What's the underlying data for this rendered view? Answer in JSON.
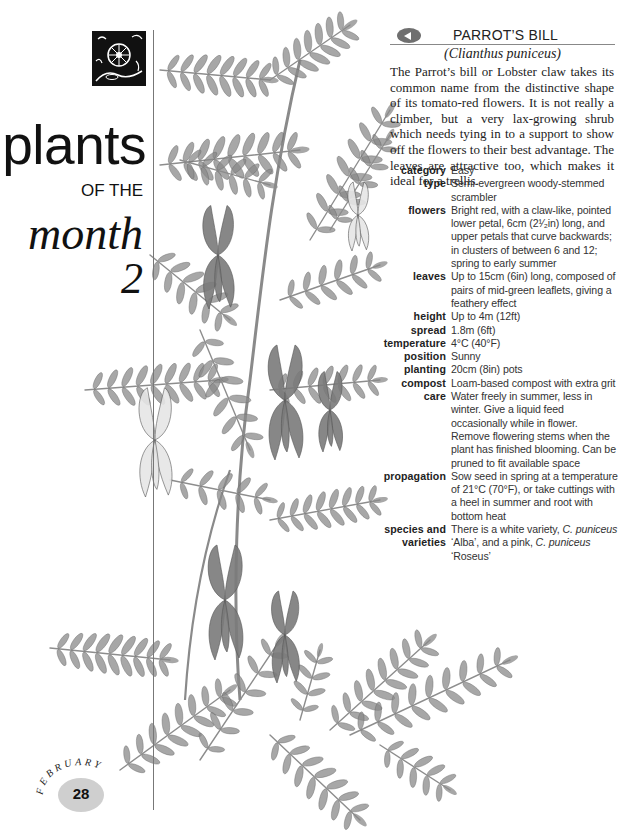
{
  "section": {
    "title_line1": "plants",
    "title_line2": "OF THE",
    "title_line3": "month",
    "title_number": "2",
    "logo_icon": "woodcut-flower-icon"
  },
  "page_badge": {
    "month": "FEBRUARY",
    "page_number": "28",
    "color": "#cfcfcf"
  },
  "entry": {
    "nav_icon": "arrow-left-icon",
    "common_name": "PARROT’S BILL",
    "latin_name": "(Clianthus puniceus)",
    "intro": "The Parrot’s bill or Lobster claw takes its common name from the distinctive shape of its tomato-red flowers. It is not really a climber, but a very lax-growing shrub which needs tying in to a support to show off the flowers to their best advantage. The leaves are attractive too, which makes it ideal for a trellis.",
    "facts": [
      {
        "label": "category",
        "value": "Easy"
      },
      {
        "label": "type",
        "value": "Semi-evergreen woody-stemmed scrambler"
      },
      {
        "label": "flowers",
        "value": "Bright red, with a claw-like, pointed lower petal, 6cm (2¹⁄₂in) long, and upper petals that curve backwards; in clusters of between 6 and 12; spring to early summer"
      },
      {
        "label": "leaves",
        "value": "Up to 15cm (6in) long, composed of pairs of mid-green leaflets, giving a feathery effect"
      },
      {
        "label": "height",
        "value": "Up to 4m (12ft)"
      },
      {
        "label": "spread",
        "value": "1.8m (6ft)"
      },
      {
        "label": "temperature",
        "value": "4°C (40°F)"
      },
      {
        "label": "position",
        "value": "Sunny"
      },
      {
        "label": "planting",
        "value": "20cm (8in) pots"
      },
      {
        "label": "compost",
        "value": "Loam-based compost with extra grit"
      },
      {
        "label": "care",
        "value": "Water freely in summer, less in winter. Give a liquid feed occasionally while in flower. Remove flowering stems when the plant has finished blooming. Can be pruned to fit available space"
      },
      {
        "label": "propagation",
        "value": "Sow seed in spring at a temperature of 21°C (70°F), or take cuttings with a heel in summer and root with bottom heat"
      },
      {
        "label_lines": [
          "species and",
          "varieties"
        ],
        "value_parts": [
          {
            "text": "There is a white variety, ",
            "italic": false
          },
          {
            "text": "C. puniceus",
            "italic": true
          },
          {
            "text": " ‘Alba’, and a pink, ",
            "italic": false
          },
          {
            "text": "C. puniceus",
            "italic": true
          },
          {
            "text": " ‘Roseus’",
            "italic": false
          }
        ]
      }
    ]
  },
  "illustration": {
    "subject": "Clianthus puniceus botanical drawing",
    "leaf_color": "#8a8a8a",
    "flower_color": "#7a7a7a",
    "white_flower_color": "#e6e6e6"
  }
}
